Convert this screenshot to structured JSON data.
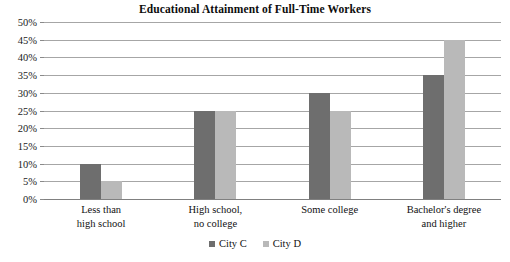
{
  "chart_data": {
    "type": "bar",
    "title": "Educational Attainment of Full-Time Workers",
    "xlabel": "",
    "ylabel": "",
    "ylim": [
      0,
      50
    ],
    "ytick_step": 5,
    "ytick_suffix": "%",
    "grid": true,
    "legend_position": "bottom",
    "categories": [
      "Less than\nhigh school",
      "High school,\nno college",
      "Some college",
      "Bachelor's degree\nand higher"
    ],
    "ticklabels": [
      "0%",
      "5%",
      "10%",
      "15%",
      "20%",
      "25%",
      "30%",
      "35%",
      "40%",
      "45%",
      "50%"
    ],
    "series": [
      {
        "name": "City C",
        "color": "#6e6e6e",
        "values": [
          10,
          25,
          30,
          35
        ]
      },
      {
        "name": "City D",
        "color": "#b9b9b9",
        "values": [
          5,
          25,
          25,
          45
        ]
      }
    ]
  },
  "colors": {
    "gridline": "#a6a6a6",
    "baseline": "#808080",
    "text": "#111111",
    "background": "#ffffff"
  }
}
